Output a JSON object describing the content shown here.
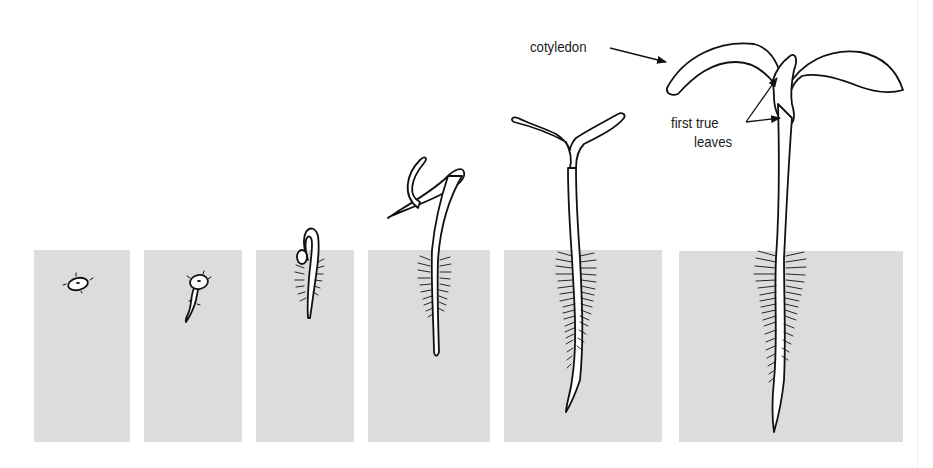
{
  "figure": {
    "soil_color": "#dcdcdc",
    "ink_color": "#111111",
    "stages": [
      {
        "index": 1,
        "description": "seed in soil",
        "panel": {
          "x": 34,
          "y": 250,
          "w": 96,
          "h": 192
        }
      },
      {
        "index": 2,
        "description": "radicle emerging from seed",
        "panel": {
          "x": 144,
          "y": 250,
          "w": 98,
          "h": 192
        }
      },
      {
        "index": 3,
        "description": "hypocotyl hook breaking soil surface",
        "panel": {
          "x": 256,
          "y": 250,
          "w": 98,
          "h": 192
        }
      },
      {
        "index": 4,
        "description": "shoot emerging with root hairs",
        "panel": {
          "x": 368,
          "y": 250,
          "w": 122,
          "h": 192
        }
      },
      {
        "index": 5,
        "description": "upright seedling with closed cotyledons",
        "panel": {
          "x": 504,
          "y": 250,
          "w": 158,
          "h": 192
        }
      },
      {
        "index": 6,
        "description": "seedling with open cotyledons and first true leaves",
        "panel": {
          "x": 679,
          "y": 251,
          "w": 224,
          "h": 191
        }
      }
    ],
    "labels": {
      "cotyledon": "cotyledon",
      "first_true_leaves_line1": "first true",
      "first_true_leaves_line2": "leaves"
    }
  }
}
